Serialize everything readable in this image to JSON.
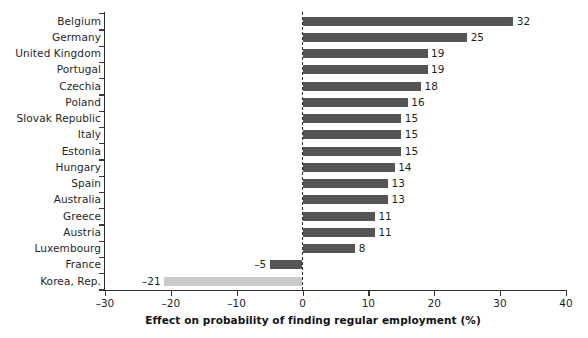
{
  "chart_data": {
    "type": "bar",
    "orientation": "horizontal",
    "title": "",
    "subtitle": "",
    "xlabel": "Effect on probability of finding regular employment (%)",
    "ylabel": "",
    "xlim": [
      -30,
      40
    ],
    "xticks": [
      -30,
      -20,
      -10,
      0,
      10,
      20,
      30,
      40
    ],
    "xtick_labels": [
      "–30",
      "–20",
      "–10",
      "0",
      "10",
      "20",
      "30",
      "40"
    ],
    "grid": false,
    "legend": null,
    "zero_reference_line": true,
    "categories": [
      "Belgium",
      "Germany",
      "United Kingdom",
      "Portugal",
      "Czechia",
      "Poland",
      "Slovak Republic",
      "Italy",
      "Estonia",
      "Hungary",
      "Spain",
      "Australia",
      "Greece",
      "Austria",
      "Luxembourg",
      "France",
      "Korea, Rep."
    ],
    "values": [
      32,
      25,
      19,
      19,
      18,
      16,
      15,
      15,
      15,
      14,
      13,
      13,
      11,
      11,
      8,
      -5,
      -21
    ],
    "value_labels": [
      "32",
      "25",
      "19",
      "19",
      "18",
      "16",
      "15",
      "15",
      "15",
      "14",
      "13",
      "13",
      "11",
      "11",
      "8",
      "–5",
      "–21"
    ],
    "bar_colors": [
      "#555555",
      "#555555",
      "#555555",
      "#555555",
      "#555555",
      "#555555",
      "#555555",
      "#555555",
      "#555555",
      "#555555",
      "#555555",
      "#555555",
      "#555555",
      "#555555",
      "#555555",
      "#555555",
      "#c9c9c9"
    ],
    "highlight_category": "Korea, Rep.",
    "colors": {
      "bar_default": "#555555",
      "bar_highlight": "#c9c9c9",
      "axis": "#2b2b2b",
      "text": "#1f1f1f",
      "background": "#ffffff"
    }
  }
}
